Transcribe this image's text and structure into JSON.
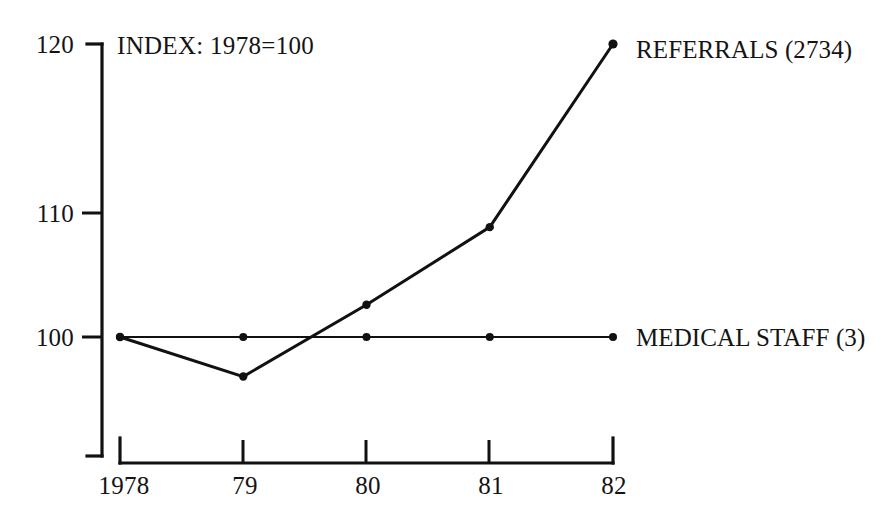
{
  "chart_data": {
    "type": "line",
    "title": "",
    "annotation": "INDEX: 1978=100",
    "xlabel": "",
    "ylabel": "",
    "categories": [
      "1978",
      "79",
      "80",
      "81",
      "82"
    ],
    "x_tick_labels": [
      "1978",
      "79",
      "80",
      "81",
      "82"
    ],
    "y_tick_labels": [
      "120",
      "110",
      "100"
    ],
    "y_ticks": [
      120,
      110,
      100
    ],
    "ylim": [
      96,
      122
    ],
    "xlim": [
      1978,
      1982
    ],
    "grid": false,
    "legend_position": "right-inline",
    "series": [
      {
        "name": "REFERRALS (2734)",
        "label": "REFERRALS (2734)",
        "values": [
          100,
          97.3,
          102.2,
          107.5,
          120
        ]
      },
      {
        "name": "MEDICAL STAFF (3)",
        "label": "MEDICAL STAFF (3)",
        "values": [
          100,
          100,
          100,
          100,
          100
        ]
      }
    ]
  },
  "labels": {
    "y_120": "120",
    "y_110": "110",
    "y_100": "100",
    "x_1978": "1978",
    "x_79": "79",
    "x_80": "80",
    "x_81": "81",
    "x_82": "82",
    "index_note": "INDEX: 1978=100",
    "referrals": "REFERRALS (2734)",
    "medical_staff": "MEDICAL STAFF (3)"
  },
  "colors": {
    "ink": "#111111",
    "background": "#ffffff"
  }
}
